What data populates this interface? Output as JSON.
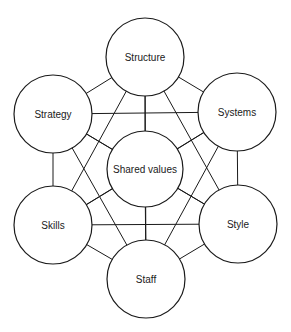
{
  "diagram": {
    "type": "network",
    "stroke_color": "#1a1a1a",
    "background": "#ffffff",
    "nodes": [
      {
        "id": "structure",
        "label": "Structure",
        "cx": 145,
        "cy": 57,
        "r": 39
      },
      {
        "id": "strategy",
        "label": "Strategy",
        "cx": 53,
        "cy": 114,
        "r": 39
      },
      {
        "id": "systems",
        "label": "Systems",
        "cx": 237,
        "cy": 112,
        "r": 39
      },
      {
        "id": "shared-values",
        "label": "Shared values",
        "cx": 145,
        "cy": 169,
        "r": 38
      },
      {
        "id": "skills",
        "label": "Skills",
        "cx": 53,
        "cy": 225,
        "r": 39
      },
      {
        "id": "style",
        "label": "Style",
        "cx": 238,
        "cy": 224,
        "r": 39
      },
      {
        "id": "staff",
        "label": "Staff",
        "cx": 146,
        "cy": 279,
        "r": 39
      }
    ],
    "edges": [
      [
        "structure",
        "strategy"
      ],
      [
        "structure",
        "systems"
      ],
      [
        "structure",
        "shared-values"
      ],
      [
        "structure",
        "skills"
      ],
      [
        "structure",
        "style"
      ],
      [
        "structure",
        "staff"
      ],
      [
        "strategy",
        "systems"
      ],
      [
        "strategy",
        "shared-values"
      ],
      [
        "strategy",
        "skills"
      ],
      [
        "strategy",
        "style"
      ],
      [
        "strategy",
        "staff"
      ],
      [
        "systems",
        "shared-values"
      ],
      [
        "systems",
        "skills"
      ],
      [
        "systems",
        "style"
      ],
      [
        "systems",
        "staff"
      ],
      [
        "shared-values",
        "skills"
      ],
      [
        "shared-values",
        "style"
      ],
      [
        "shared-values",
        "staff"
      ],
      [
        "skills",
        "style"
      ],
      [
        "skills",
        "staff"
      ],
      [
        "style",
        "staff"
      ]
    ]
  }
}
